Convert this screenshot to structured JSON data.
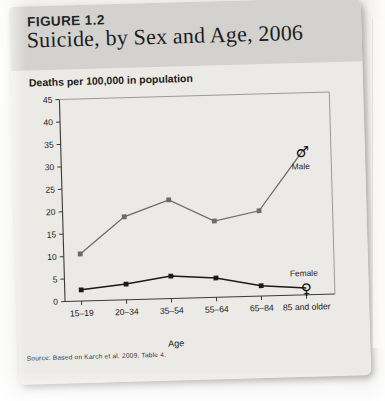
{
  "figure": {
    "number_label": "FIGURE 1.2",
    "title": "Suicide, by Sex and Age, 2006",
    "subtitle": "Deaths per 100,000 in population",
    "source_note": "Source: Based on Karch et al. 2009, Table 4."
  },
  "chart_data": {
    "type": "line",
    "title": "Suicide, by Sex and Age, 2006",
    "subtitle": "Deaths per 100,000 in population",
    "xlabel": "Age",
    "ylabel": "Deaths per 100,000 in population",
    "categories": [
      "15–19",
      "20–34",
      "35–54",
      "55–64",
      "65–84",
      "85 and older"
    ],
    "ylim": [
      0,
      45
    ],
    "yticks": [
      0,
      5,
      10,
      15,
      20,
      25,
      30,
      35,
      40,
      45
    ],
    "ytick_labels": [
      "0",
      "5",
      "10",
      "15",
      "20",
      "25",
      "30",
      "35",
      "40",
      "45"
    ],
    "grid": false,
    "legend_position": "inline-end-of-line",
    "series": [
      {
        "name": "Male",
        "label": "Male",
        "symbol": "♂",
        "color": "#6b6b6b",
        "marker": "square",
        "values": [
          10.5,
          18.5,
          22.0,
          17.0,
          19.0,
          32.0
        ]
      },
      {
        "name": "Female",
        "label": "Female",
        "symbol": "♀",
        "color": "#1a1a1a",
        "marker": "square",
        "values": [
          2.5,
          3.5,
          5.0,
          4.3,
          2.3,
          1.5
        ]
      }
    ],
    "annotations": [
      {
        "text": "Male",
        "series": "Male",
        "at_category": "85 and older"
      },
      {
        "text": "Female",
        "series": "Female",
        "at_category": "85 and older"
      }
    ]
  },
  "colors": {
    "header_band": "#d3d2cf",
    "page": "#eceae6",
    "male_line": "#6b6b6b",
    "female_line": "#1a1a1a",
    "axis": "#3a3a3a"
  }
}
